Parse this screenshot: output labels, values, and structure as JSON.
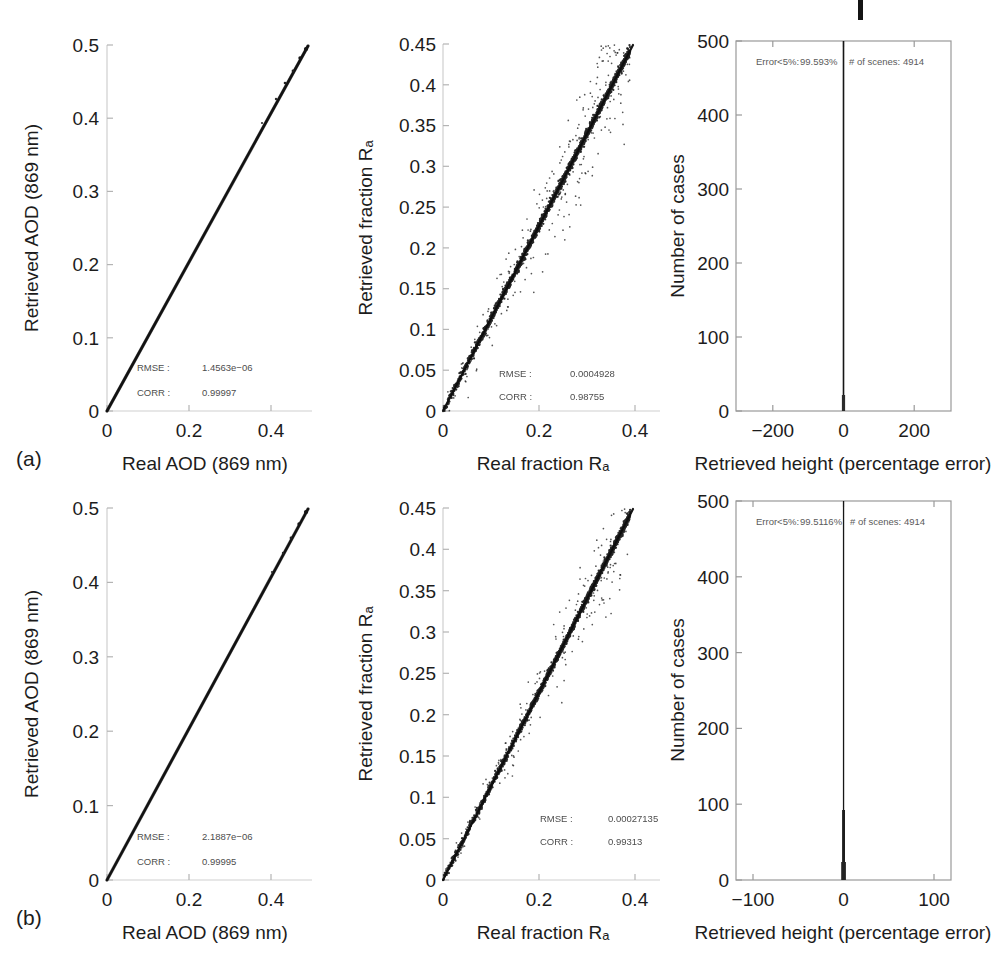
{
  "figure": {
    "width": 996,
    "height": 962,
    "background": "#ffffff",
    "ink": "#1c1c1c",
    "axis_color": "#c9c9c9",
    "box_color": "#9a9a9a",
    "data_color": "#111111",
    "crop_mark": {
      "present": true,
      "x": 858,
      "y": 0,
      "width": 5,
      "height": 20
    }
  },
  "row_tags": {
    "a": "(a)",
    "b": "(b)"
  },
  "chart_data": [
    {
      "id": "a-aod",
      "row": "a",
      "type": "scatter",
      "title": "",
      "xlabel": "Real AOD (869 nm)",
      "ylabel": "Retrieved AOD (869 nm)",
      "xlim": [
        0,
        0.5
      ],
      "ylim": [
        0,
        0.5
      ],
      "xticks": [
        0,
        0.2,
        0.4
      ],
      "xticklabels": [
        "0",
        "0.2",
        "0.4"
      ],
      "yticks": [
        0,
        0.1,
        0.2,
        0.3,
        0.4,
        0.5
      ],
      "yticklabels": [
        "0",
        "0.1",
        "0.2",
        "0.3",
        "0.4",
        "0.5"
      ],
      "grid": false,
      "legend": "none",
      "description": "Near-perfect 1:1 dense line of points from (0,0) to (0.5,0.5)",
      "annotations": [
        {
          "label": "RMSE :",
          "value": "1.4563e−06"
        },
        {
          "label": "CORR :",
          "value": "0.99997"
        }
      ],
      "series": [
        {
          "name": "retrieved vs real AOD",
          "slope": 1.0,
          "intercept": 0.0,
          "n_points": 4914,
          "spread": 0.0015
        }
      ]
    },
    {
      "id": "a-fraction",
      "row": "a",
      "type": "scatter",
      "title": "",
      "xlabel": "Real fraction Rₐ",
      "ylabel": "Retrieved fraction Rₐ",
      "xlim": [
        0,
        0.45
      ],
      "ylim": [
        0,
        0.45
      ],
      "xticks": [
        0,
        0.2,
        0.4
      ],
      "xticklabels": [
        "0",
        "0.2",
        "0.4"
      ],
      "yticks": [
        0,
        0.05,
        0.1,
        0.15,
        0.2,
        0.25,
        0.3,
        0.35,
        0.4,
        0.45
      ],
      "yticklabels": [
        "0",
        "0.05",
        "0.1",
        "0.15",
        "0.2",
        "0.25",
        "0.3",
        "0.35",
        "0.4",
        "0.45"
      ],
      "grid": false,
      "legend": "none",
      "description": "Dense 1:1 band with a halo of scattered outliers above and below the diagonal",
      "annotations": [
        {
          "label": "RMSE :",
          "value": "0.0004928"
        },
        {
          "label": "CORR :",
          "value": "0.98755"
        }
      ],
      "series": [
        {
          "name": "retrieved vs real fraction",
          "slope": 1.0,
          "intercept": 0.0,
          "n_points": 4914,
          "core_spread": 0.003,
          "outlier_spread": 0.03,
          "outlier_fraction": 0.13
        }
      ]
    },
    {
      "id": "a-height-hist",
      "row": "a",
      "type": "bar",
      "title": "",
      "xlabel": "Retrieved height (percentage error)",
      "ylabel": "Number of cases",
      "xlim": [
        -300,
        300
      ],
      "ylim": [
        0,
        500
      ],
      "xticks": [
        -200,
        0,
        200
      ],
      "xticklabels": [
        "−200",
        "0",
        "200"
      ],
      "yticks": [
        0,
        100,
        200,
        300,
        400,
        500
      ],
      "yticklabels": [
        "0",
        "100",
        "200",
        "300",
        "400",
        "500"
      ],
      "grid": false,
      "legend": "none",
      "description": "Extremely narrow spike centred at 0 percentage error; histogram reaches the top of the axis",
      "annotation_text": "Error<5%: 99.593% # of scenes: 4914",
      "annotation_parts": {
        "error_label": "Error<5%:",
        "error_value": "99.593%",
        "scenes_label": "# of scenes:",
        "scenes_value": "4914"
      },
      "categories": [
        0
      ],
      "values": [
        500
      ],
      "spike_center": 0,
      "spike_half_width_units": 1.4
    },
    {
      "id": "b-aod",
      "row": "b",
      "type": "scatter",
      "title": "",
      "xlabel": "Real AOD (869 nm)",
      "ylabel": "Retrieved AOD (869 nm)",
      "xlim": [
        0,
        0.5
      ],
      "ylim": [
        0,
        0.5
      ],
      "xticks": [
        0,
        0.2,
        0.4
      ],
      "xticklabels": [
        "0",
        "0.2",
        "0.4"
      ],
      "yticks": [
        0,
        0.1,
        0.2,
        0.3,
        0.4,
        0.5
      ],
      "yticklabels": [
        "0",
        "0.1",
        "0.2",
        "0.3",
        "0.4",
        "0.5"
      ],
      "grid": false,
      "legend": "none",
      "description": "Near-perfect 1:1 dense line of points from (0,0) to (0.5,0.5)",
      "annotations": [
        {
          "label": "RMSE :",
          "value": "2.1887e−06"
        },
        {
          "label": "CORR :",
          "value": "0.99995"
        }
      ],
      "series": [
        {
          "name": "retrieved vs real AOD",
          "slope": 1.0,
          "intercept": 0.0,
          "n_points": 4914,
          "spread": 0.0015
        }
      ]
    },
    {
      "id": "b-fraction",
      "row": "b",
      "type": "scatter",
      "title": "",
      "xlabel": "Real fraction Rₐ",
      "ylabel": "Retrieved fraction Rₐ",
      "xlim": [
        0,
        0.45
      ],
      "ylim": [
        0,
        0.45
      ],
      "xticks": [
        0,
        0.2,
        0.4
      ],
      "xticklabels": [
        "0",
        "0.2",
        "0.4"
      ],
      "yticks": [
        0,
        0.05,
        0.1,
        0.15,
        0.2,
        0.25,
        0.3,
        0.35,
        0.4,
        0.45
      ],
      "yticklabels": [
        "0",
        "0.05",
        "0.1",
        "0.15",
        "0.2",
        "0.25",
        "0.3",
        "0.35",
        "0.4",
        "0.45"
      ],
      "grid": false,
      "legend": "none",
      "description": "Dense 1:1 band, tighter than panel (a) with fewer scattered outliers",
      "annotations": [
        {
          "label": "RMSE :",
          "value": "0.00027135"
        },
        {
          "label": "CORR :",
          "value": "0.99313"
        }
      ],
      "series": [
        {
          "name": "retrieved vs real fraction",
          "slope": 1.0,
          "intercept": 0.0,
          "n_points": 4914,
          "core_spread": 0.0025,
          "outlier_spread": 0.022,
          "outlier_fraction": 0.09
        }
      ]
    },
    {
      "id": "b-height-hist",
      "row": "b",
      "type": "bar",
      "title": "",
      "xlabel": "Retrieved height (percentage error)",
      "ylabel": "Number of cases",
      "xlim": [
        -130,
        130
      ],
      "ylim": [
        0,
        500
      ],
      "xticks": [
        -100,
        0,
        100
      ],
      "xticklabels": [
        "−100",
        "0",
        "100"
      ],
      "yticks": [
        0,
        100,
        200,
        300,
        400,
        500
      ],
      "yticklabels": [
        "0",
        "100",
        "200",
        "300",
        "400",
        "500"
      ],
      "grid": false,
      "legend": "none",
      "description": "Extremely narrow spike centred at 0 percentage error; histogram reaches the top of the axis with a slightly flared base",
      "annotation_text": "Error<5%: 99.5116% # of scenes: 4914",
      "annotation_parts": {
        "error_label": "Error<5%:",
        "error_value": "99.5116%",
        "scenes_label": "# of scenes:",
        "scenes_value": "4914"
      },
      "categories": [
        0
      ],
      "values": [
        500
      ],
      "spike_center": 0,
      "spike_half_width_units": 0.8
    }
  ]
}
